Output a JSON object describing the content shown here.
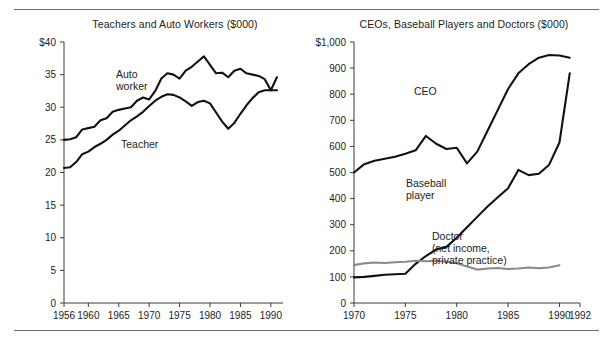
{
  "figure": {
    "background_color": "#ffffff",
    "rule_color": "#6f6f6f"
  },
  "chart_data": [
    {
      "id": "teachers-auto-workers",
      "type": "line",
      "title": "Teachers and Auto Workers ($000)",
      "xlabel": "",
      "ylabel": "",
      "xlim": [
        1956,
        1992
      ],
      "ylim": [
        0,
        40
      ],
      "grid": false,
      "legend_position": "inline-annotation",
      "y_ticks": [
        0,
        5,
        10,
        15,
        20,
        25,
        30,
        35,
        40
      ],
      "y_tick_labels": [
        "0",
        "5",
        "10",
        "15",
        "20",
        "25",
        "30",
        "35",
        "$40"
      ],
      "x_ticks": [
        1956,
        1960,
        1965,
        1970,
        1975,
        1980,
        1985,
        1990
      ],
      "x_tick_labels": [
        "1956",
        "1960",
        "1965",
        "1970",
        "1975",
        "1980",
        "1985",
        "1990"
      ],
      "series": [
        {
          "name": "Auto worker",
          "color": "#111111",
          "label_text": "Auto\nworker",
          "x": [
            1956,
            1957,
            1958,
            1959,
            1960,
            1961,
            1962,
            1963,
            1964,
            1965,
            1966,
            1967,
            1968,
            1969,
            1970,
            1971,
            1972,
            1973,
            1974,
            1975,
            1976,
            1977,
            1978,
            1979,
            1980,
            1981,
            1982,
            1983,
            1984,
            1985,
            1986,
            1987,
            1988,
            1989,
            1990,
            1991
          ],
          "values": [
            25.0,
            25.1,
            25.4,
            26.6,
            26.8,
            27.0,
            28.0,
            28.3,
            29.3,
            29.6,
            29.8,
            30.0,
            31.0,
            31.5,
            31.2,
            32.5,
            34.4,
            35.2,
            35.0,
            34.4,
            35.6,
            36.2,
            37.0,
            37.8,
            36.5,
            35.2,
            35.3,
            34.6,
            35.6,
            35.9,
            35.2,
            35.0,
            34.8,
            34.3,
            32.6,
            34.6
          ]
        },
        {
          "name": "Teacher",
          "color": "#111111",
          "label_text": "Teacher",
          "x": [
            1956,
            1957,
            1958,
            1959,
            1960,
            1961,
            1962,
            1963,
            1964,
            1965,
            1966,
            1967,
            1968,
            1969,
            1970,
            1971,
            1972,
            1973,
            1974,
            1975,
            1976,
            1977,
            1978,
            1979,
            1980,
            1981,
            1982,
            1983,
            1984,
            1985,
            1986,
            1987,
            1988,
            1989,
            1990,
            1991
          ],
          "values": [
            20.7,
            20.8,
            21.6,
            22.8,
            23.2,
            23.9,
            24.4,
            25.0,
            25.8,
            26.4,
            27.2,
            28.0,
            28.6,
            29.3,
            30.2,
            31.0,
            31.6,
            32.0,
            31.9,
            31.5,
            30.9,
            30.2,
            30.8,
            31.0,
            30.6,
            29.2,
            27.8,
            26.7,
            27.6,
            29.0,
            30.3,
            31.4,
            32.3,
            32.6,
            32.6,
            32.6
          ]
        }
      ]
    },
    {
      "id": "ceos-baseball-doctors",
      "type": "line",
      "title": "CEOs, Baseball Players and Doctors ($000)",
      "xlabel": "",
      "ylabel": "",
      "xlim": [
        1970,
        1992
      ],
      "ylim": [
        0,
        1000
      ],
      "grid": false,
      "legend_position": "inline-annotation",
      "y_ticks": [
        0,
        100,
        200,
        300,
        400,
        500,
        600,
        700,
        800,
        900,
        1000
      ],
      "y_tick_labels": [
        "0",
        "100",
        "200",
        "300",
        "400",
        "500",
        "600",
        "700",
        "800",
        "900",
        "$1,000"
      ],
      "x_ticks": [
        1970,
        1975,
        1980,
        1985,
        1990,
        1992
      ],
      "x_tick_labels": [
        "1970",
        "1975",
        "1980",
        "1985",
        "1990",
        "1992"
      ],
      "series": [
        {
          "name": "CEO",
          "color": "#111111",
          "label_text": "CEO",
          "x": [
            1970,
            1971,
            1972,
            1973,
            1974,
            1975,
            1976,
            1977,
            1978,
            1979,
            1980,
            1981,
            1982,
            1983,
            1984,
            1985,
            1986,
            1987,
            1988,
            1989,
            1990,
            1991
          ],
          "values": [
            500,
            532,
            545,
            553,
            560,
            572,
            585,
            640,
            610,
            590,
            595,
            535,
            580,
            660,
            740,
            820,
            880,
            915,
            940,
            950,
            948,
            940
          ]
        },
        {
          "name": "Baseball player",
          "color": "#111111",
          "label_text": "Baseball\nplayer",
          "x": [
            1970,
            1971,
            1972,
            1973,
            1974,
            1975,
            1976,
            1977,
            1978,
            1979,
            1980,
            1981,
            1982,
            1983,
            1984,
            1985,
            1986,
            1987,
            1988,
            1989,
            1990,
            1991
          ],
          "values": [
            98,
            100,
            104,
            108,
            110,
            112,
            150,
            180,
            205,
            215,
            250,
            290,
            330,
            370,
            405,
            440,
            510,
            490,
            495,
            530,
            615,
            880
          ]
        },
        {
          "name": "Doctor (net income, private practice)",
          "color": "#8a8a8a",
          "label_text": "Doctor\n(net income,\nprivate practice)",
          "x": [
            1970,
            1971,
            1972,
            1973,
            1974,
            1975,
            1976,
            1977,
            1978,
            1979,
            1980,
            1981,
            1982,
            1983,
            1984,
            1985,
            1986,
            1987,
            1988,
            1989,
            1990
          ],
          "values": [
            145,
            152,
            155,
            153,
            156,
            158,
            162,
            160,
            162,
            158,
            152,
            140,
            128,
            132,
            134,
            130,
            132,
            136,
            133,
            136,
            145
          ]
        }
      ]
    }
  ]
}
